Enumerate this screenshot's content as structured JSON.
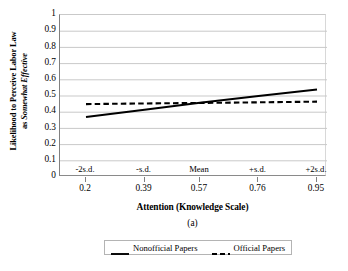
{
  "chart_data": {
    "type": "line",
    "title": "",
    "caption": "(a)",
    "xlabel": "Attention (Knowledge Scale)",
    "ylabel_line1": "Likelihood to Perceive Labor Law",
    "ylabel_line2_prefix": "as ",
    "ylabel_line2_italic": "Somewhat Effective",
    "x": [
      0.2,
      0.39,
      0.57,
      0.76,
      0.95
    ],
    "xtick_labels": [
      "0.2",
      "0.39",
      "0.57",
      "0.76",
      "0.95"
    ],
    "category_labels": [
      "-2s.d.",
      "-s.d.",
      "Mean",
      "+s.d.",
      "+2s.d."
    ],
    "xlim": [
      0.2,
      0.95
    ],
    "ylim": [
      0,
      1
    ],
    "ytick_labels": [
      "1",
      "0.9",
      "0.8",
      "0.7",
      "0.6",
      "0.5",
      "0.4",
      "0.3",
      "0.2",
      "0.1",
      "0"
    ],
    "ytick_values": [
      1,
      0.9,
      0.8,
      0.7,
      0.6,
      0.5,
      0.4,
      0.3,
      0.2,
      0.1,
      0
    ],
    "grid": true,
    "grid_axis": "y",
    "legend_position": "bottom",
    "series": [
      {
        "name": "Nonofficial Papers",
        "style": "solid",
        "color": "#000000",
        "values": [
          0.37,
          0.415,
          0.458,
          0.5,
          0.54
        ]
      },
      {
        "name": "Official Papers",
        "style": "dashed",
        "color": "#000000",
        "values": [
          0.45,
          0.454,
          0.457,
          0.461,
          0.465
        ]
      }
    ]
  },
  "legend": {
    "items": [
      {
        "label": "Nonofficial Papers",
        "style": "solid"
      },
      {
        "label": "Official Papers",
        "style": "dashed"
      }
    ]
  },
  "colors": {
    "ink": "#000000",
    "gridline": "#c9c9c9",
    "axis": "#808080",
    "background": "#ffffff"
  }
}
